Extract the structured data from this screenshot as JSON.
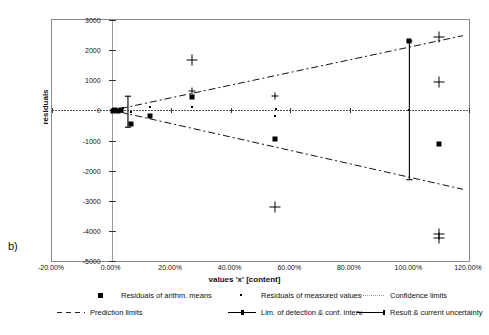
{
  "panel": {
    "label": "b)"
  },
  "chart_data": {
    "type": "scatter",
    "title": "",
    "xlabel": "values 'x' [content]",
    "ylabel": "residuals\nsignal values 'y'",
    "ylabel_line1": "residuals",
    "ylabel_line2": "signal values 'y'",
    "xlim": [
      -20,
      120
    ],
    "ylim": [
      -5000,
      3000
    ],
    "xticks": [
      -20,
      0,
      20,
      40,
      60,
      80,
      100,
      120
    ],
    "xtick_labels": [
      "-20.00%",
      "0.00%",
      "20.00%",
      "40.00%",
      "60.00%",
      "80.00%",
      "100.00%",
      "120.00%"
    ],
    "yticks": [
      3000,
      2000,
      1000,
      0,
      -1000,
      -2000,
      -3000,
      -4000,
      -5000
    ],
    "ytick_labels": [
      "3000",
      "2000",
      "1000",
      "0",
      "-1000",
      "-2000",
      "-3000",
      "-4000",
      "-5000"
    ],
    "grid": false,
    "legend_position": "bottom",
    "series": [
      {
        "name": "Residuals of arithm. means",
        "marker": "square",
        "points": [
          [
            0.5,
            -20
          ],
          [
            1.2,
            10
          ],
          [
            2.0,
            -30
          ],
          [
            3.0,
            20
          ],
          [
            6.5,
            -450
          ],
          [
            13.0,
            -190
          ],
          [
            27.0,
            430
          ],
          [
            55.0,
            -960
          ],
          [
            100.0,
            2300
          ],
          [
            110.0,
            -1130
          ]
        ]
      },
      {
        "name": "Residuals of measured values",
        "marker": "dot",
        "points": [
          [
            0.4,
            40
          ],
          [
            0.9,
            -40
          ],
          [
            1.6,
            60
          ],
          [
            2.4,
            -60
          ],
          [
            3.2,
            30
          ],
          [
            4.0,
            90
          ],
          [
            6.5,
            -60
          ],
          [
            13.0,
            120
          ],
          [
            13.2,
            -200
          ],
          [
            27.0,
            110
          ],
          [
            55.0,
            -190
          ],
          [
            55.3,
            30
          ],
          [
            100.0,
            0
          ]
        ]
      },
      {
        "name": "Confidence limits",
        "line": "dotted",
        "description": "near-horizontal dotted band around zero"
      },
      {
        "name": "Prediction limits",
        "line": "dash-dot",
        "upper": [
          [
            3.0,
            60
          ],
          [
            118.0,
            2480
          ]
        ],
        "lower": [
          [
            3.0,
            -60
          ],
          [
            118.0,
            -2620
          ]
        ]
      },
      {
        "name": "Lim. of detection & conf. interv.",
        "line": "solid-with-caps",
        "x": 5.5,
        "y_from": 470,
        "y_to": -560
      },
      {
        "name": "Result & current uncertainty",
        "line": "solid-with-caps",
        "x": 100.0,
        "y_from": 2300,
        "y_to": -2300
      }
    ],
    "extra_crosses": [
      [
        27.0,
        1680
      ],
      [
        27.0,
        640
      ],
      [
        55.0,
        480
      ],
      [
        55.0,
        -3200
      ],
      [
        110.0,
        2420
      ],
      [
        110.0,
        950
      ],
      [
        110.0,
        -4100
      ],
      [
        110.0,
        -4250
      ]
    ]
  },
  "legend": {
    "items": [
      {
        "label": "Residuals of arithm. means",
        "key": "square"
      },
      {
        "label": "Residuals of measured values",
        "key": "dot"
      },
      {
        "label": "Confidence limits",
        "key": "dotted"
      },
      {
        "label": "Prediction limits",
        "key": "dashed"
      },
      {
        "label": "Lim. of detection & conf. interv.",
        "key": "solid-marker"
      },
      {
        "label": "Result & current uncertainty",
        "key": "solid"
      }
    ]
  }
}
